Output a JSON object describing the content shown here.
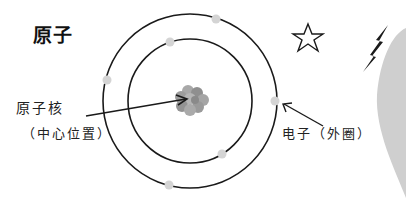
{
  "title": "原子",
  "labels": {
    "nucleus": "原子核",
    "nucleus_note": "（中心位置）",
    "electron": "电子（外圈）"
  },
  "diagram": {
    "center": [
      190,
      101
    ],
    "orbits": [
      {
        "name": "inner",
        "radius": 62
      },
      {
        "name": "outer",
        "radius": 87
      }
    ],
    "electron_count": 6
  },
  "colors": {
    "line": "#1a1a1a",
    "electron": "#d4d4d4",
    "nucleus": "#9a9a9a",
    "backdrop": "#cfcfcf"
  }
}
